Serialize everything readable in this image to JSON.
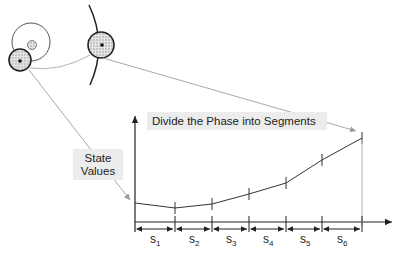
{
  "annotations": {
    "phase_label": "Divide the Phase into Segments",
    "state_label_line1": "State",
    "state_label_line2": "Values"
  },
  "segments": [
    {
      "base": "s",
      "sub": "1"
    },
    {
      "base": "s",
      "sub": "2"
    },
    {
      "base": "s",
      "sub": "3"
    },
    {
      "base": "s",
      "sub": "4"
    },
    {
      "base": "s",
      "sub": "5"
    },
    {
      "base": "s",
      "sub": "6"
    }
  ],
  "icons": {
    "orbit_cluster": "concentric-circles-icon",
    "phase_circle": "hatched-circle-icon"
  },
  "colors": {
    "line": "#333333",
    "connector": "#a8a8a8",
    "label_bg": "#ececec",
    "hatch": "#9a9a9a"
  }
}
